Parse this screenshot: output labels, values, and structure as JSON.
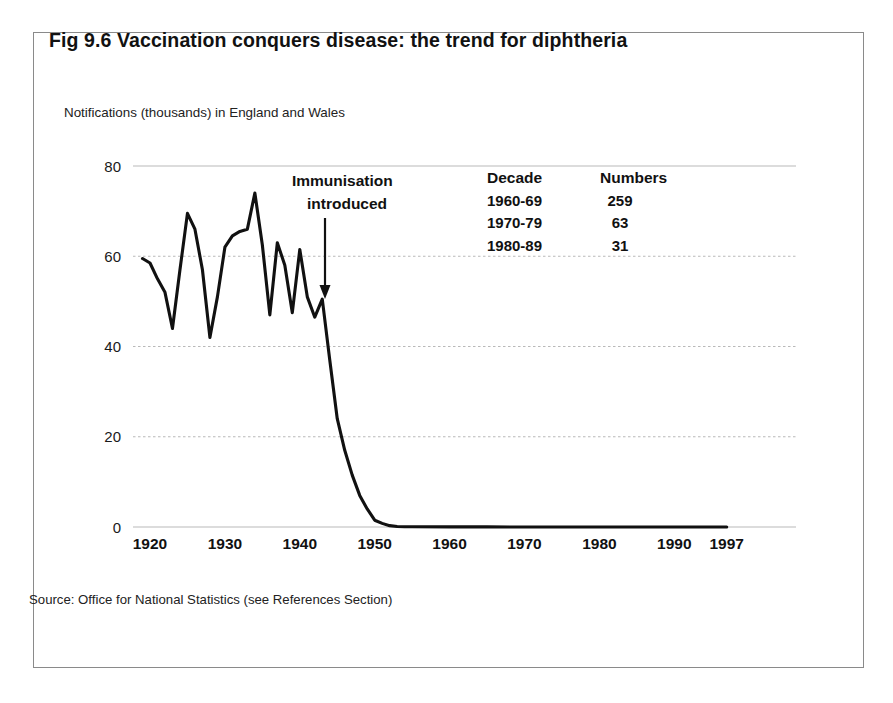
{
  "figure": {
    "title": "Fig 9.6   Vaccination conquers disease:  the trend for diphtheria",
    "axis_caption": "Notifications (thousands) in England and Wales",
    "source": "Source: Office for National Statistics (see References Section)"
  },
  "annotation": {
    "line1": "Immunisation",
    "line2": "introduced",
    "arrow_year": 1942.8
  },
  "side_table": {
    "headers": [
      "Decade",
      "Numbers"
    ],
    "rows": [
      {
        "decade": "1960-69",
        "numbers": "259"
      },
      {
        "decade": "1970-79",
        "numbers": "63"
      },
      {
        "decade": "1980-89",
        "numbers": "31"
      }
    ]
  },
  "colors": {
    "frame": "#8a8a8a",
    "gridline": "#b9b9b9",
    "line": "#111111",
    "text": "#1a1a1a",
    "background": "#ffffff"
  },
  "chart_data": {
    "type": "line",
    "title": "Fig 9.6   Vaccination conquers disease:  the trend for diphtheria",
    "subtitle": "Notifications (thousands) in England and Wales",
    "xlabel": "",
    "ylabel": "Notifications (thousands)",
    "xlim": [
      1918,
      1998
    ],
    "ylim": [
      0,
      80
    ],
    "yticks": [
      0,
      20,
      40,
      60,
      80
    ],
    "ytick_labels": [
      "0",
      "20",
      "40",
      "60",
      "80"
    ],
    "xticks": [
      1920,
      1930,
      1940,
      1950,
      1960,
      1970,
      1980,
      1990,
      1997
    ],
    "xtick_labels": [
      "1920",
      "1930",
      "1940",
      "1950",
      "1960",
      "1970",
      "1980",
      "1990",
      "1997"
    ],
    "grid": "horizontal",
    "legend": "none",
    "series": [
      {
        "name": "Diphtheria notifications (thousands), England and Wales",
        "x": [
          1919,
          1920,
          1921,
          1922,
          1923,
          1924,
          1925,
          1926,
          1927,
          1928,
          1929,
          1930,
          1931,
          1932,
          1933,
          1934,
          1935,
          1936,
          1937,
          1938,
          1939,
          1940,
          1941,
          1942,
          1943,
          1944,
          1945,
          1946,
          1947,
          1948,
          1949,
          1950,
          1951,
          1952,
          1953,
          1954,
          1955,
          1960,
          1965,
          1970,
          1975,
          1980,
          1985,
          1990,
          1997
        ],
        "y": [
          59.5,
          58.5,
          55.0,
          52.0,
          44.0,
          57.0,
          69.5,
          66.0,
          57.0,
          42.0,
          51.0,
          62.0,
          64.5,
          65.5,
          66.0,
          74.0,
          62.5,
          47.0,
          63.0,
          58.0,
          47.5,
          61.5,
          51.0,
          46.5,
          50.5,
          37.0,
          24.0,
          17.0,
          11.5,
          7.0,
          4.0,
          1.5,
          0.8,
          0.3,
          0.1,
          0.05,
          0.05,
          0.03,
          0.02,
          0.01,
          0.01,
          0.005,
          0.003,
          0.002,
          0.001
        ]
      }
    ],
    "annotations": [
      {
        "text": "Immunisation introduced",
        "x": 1942.8,
        "y": 50.5,
        "style": "arrow-down"
      }
    ],
    "inset_table": {
      "headers": [
        "Decade",
        "Numbers"
      ],
      "rows": [
        [
          "1960-69",
          "259"
        ],
        [
          "1970-79",
          "63"
        ],
        [
          "1980-89",
          "31"
        ]
      ],
      "note": "total notifications per decade"
    }
  }
}
